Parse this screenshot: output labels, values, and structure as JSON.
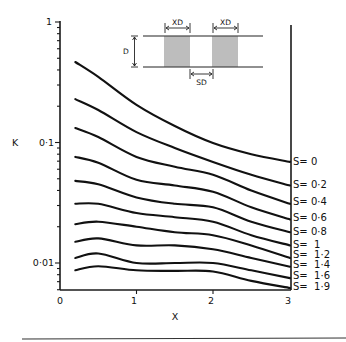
{
  "chart_data": {
    "type": "line",
    "title": "",
    "xlabel": "X",
    "ylabel": "K",
    "xlim": [
      0,
      3
    ],
    "ylim": [
      0.006,
      1
    ],
    "yscale": "log",
    "grid": false,
    "x_ticks": [
      "0",
      "1",
      "2",
      "3"
    ],
    "y_ticks": [
      "1",
      "0·1",
      "0·01"
    ],
    "legend_position": "right end of each curve",
    "x": [
      0.2,
      0.5,
      1.0,
      1.5,
      2.0,
      2.5,
      3.0
    ],
    "series": [
      {
        "name": "S= 0",
        "values": [
          0.466,
          0.35,
          0.205,
          0.137,
          0.099,
          0.08,
          0.069
        ]
      },
      {
        "name": "S= 0·2",
        "values": [
          0.229,
          0.186,
          0.122,
          0.09,
          0.069,
          0.054,
          0.044
        ]
      },
      {
        "name": "S= 0·4",
        "values": [
          0.132,
          0.111,
          0.076,
          0.063,
          0.054,
          0.04,
          0.031
        ]
      },
      {
        "name": "S= 0·6",
        "values": [
          0.076,
          0.068,
          0.049,
          0.044,
          0.039,
          0.029,
          0.023
        ]
      },
      {
        "name": "S= 0·8",
        "values": [
          0.048,
          0.045,
          0.035,
          0.031,
          0.029,
          0.022,
          0.018
        ]
      },
      {
        "name": "S=  1",
        "values": [
          0.031,
          0.031,
          0.026,
          0.024,
          0.022,
          0.017,
          0.014
        ]
      },
      {
        "name": "S=  1·2",
        "values": [
          0.021,
          0.022,
          0.02,
          0.018,
          0.017,
          0.014,
          0.011
        ]
      },
      {
        "name": "S=  1·4",
        "values": [
          0.015,
          0.016,
          0.014,
          0.014,
          0.013,
          0.011,
          0.0093
        ]
      },
      {
        "name": "S=  1·6",
        "values": [
          0.011,
          0.012,
          0.01,
          0.01,
          0.01,
          0.0087,
          0.0075
        ]
      },
      {
        "name": "S=  1·9",
        "values": [
          0.0087,
          0.0094,
          0.0087,
          0.0086,
          0.0085,
          0.0071,
          0.0062
        ]
      }
    ],
    "label_y_px": [
      165,
      188,
      205,
      221,
      235,
      248,
      258,
      268,
      279,
      290
    ],
    "inset": {
      "labels": [
        "XD",
        "XD",
        "D",
        "SD"
      ],
      "description": "Two hatched blocks of width XD between parallel lines spaced D, separated by gap SD"
    }
  }
}
